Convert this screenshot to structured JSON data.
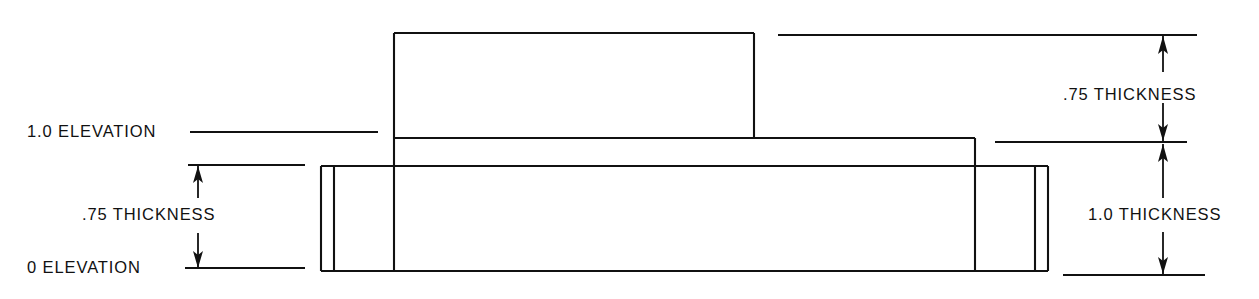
{
  "drawing": {
    "title": "Stepped plate elevation and thickness drawing",
    "line_color": "#111111",
    "background_color": "#ffffff",
    "labels": {
      "elevation_top": "1.0 ELEVATION",
      "elevation_base": "0 ELEVATION",
      "thickness_left": ".75  THICKNESS",
      "thickness_right_upper": ".75  THICKNESS",
      "thickness_right_lower": "1.0  THICKNESS"
    },
    "dimensions": [
      {
        "name": "left-thickness-dimension",
        "value": ".75",
        "label": ".75  THICKNESS",
        "unit": "THICKNESS",
        "from_elevation": "0 ELEVATION",
        "to_elevation": "1.0 ELEVATION"
      },
      {
        "name": "right-upper-thickness-dimension",
        "value": ".75",
        "label": ".75  THICKNESS",
        "unit": "THICKNESS"
      },
      {
        "name": "right-lower-thickness-dimension",
        "value": "1.0",
        "label": "1.0  THICKNESS",
        "unit": "THICKNESS"
      }
    ],
    "elevations": [
      {
        "name": "upper-elevation",
        "value": "1.0",
        "label": "1.0 ELEVATION"
      },
      {
        "name": "base-elevation",
        "value": "0",
        "label": "0 ELEVATION"
      }
    ]
  }
}
